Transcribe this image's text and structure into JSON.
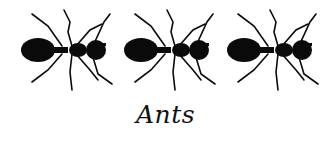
{
  "illustration": {
    "ant_count": 3,
    "ant_color": "#0a0a0a",
    "background": "#ffffff",
    "caption": "Ants"
  }
}
